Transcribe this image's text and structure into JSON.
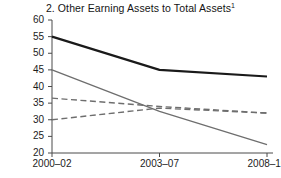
{
  "chart_data": {
    "type": "line",
    "title": "2. Other Earning Assets to Total Assets",
    "title_superscript": "1",
    "xlabel": "",
    "ylabel": "",
    "categories": [
      "2000–02",
      "2003–07",
      "2008–10"
    ],
    "ylim": [
      20,
      60
    ],
    "yticks": [
      20,
      25,
      30,
      35,
      40,
      45,
      50,
      55,
      60
    ],
    "ytick_labels": [
      "20",
      "25",
      "30",
      "35",
      "40",
      "45",
      "50",
      "55",
      "60"
    ],
    "grid": false,
    "legend": "none",
    "series": [
      {
        "name": "series-1-black-solid",
        "style": "solid",
        "color": "#1a1a1a",
        "width": 2.1,
        "values": [
          55.0,
          45.0,
          43.0
        ]
      },
      {
        "name": "series-2-gray-solid",
        "style": "solid",
        "color": "#6e6e6e",
        "width": 1.3,
        "values": [
          45.0,
          32.5,
          22.5
        ]
      },
      {
        "name": "series-3-gray-dashed-upper",
        "style": "dashed",
        "color": "#6e6e6e",
        "width": 1.4,
        "values": [
          36.5,
          34.0,
          32.0
        ]
      },
      {
        "name": "series-4-gray-dashed-lower",
        "style": "dashed",
        "color": "#6e6e6e",
        "width": 1.4,
        "values": [
          30.0,
          33.5,
          32.0
        ]
      }
    ]
  },
  "axes": {
    "y_top_value": 60,
    "y_bottom_value": 20,
    "x_left_px": 52,
    "x_right_px": 273,
    "y_top_px": 20,
    "y_bottom_px": 153
  }
}
